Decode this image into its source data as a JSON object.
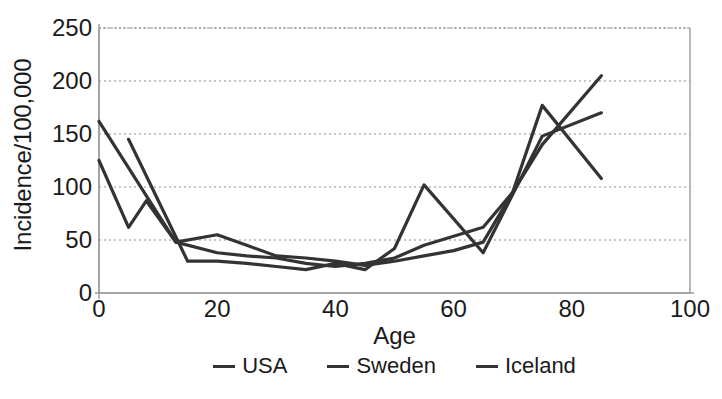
{
  "chart_data": {
    "type": "line",
    "title": "",
    "xlabel": "Age",
    "ylabel": "Incidence/100,000",
    "xlim": [
      0,
      100
    ],
    "ylim": [
      0,
      250
    ],
    "xticks": [
      0,
      20,
      40,
      60,
      80,
      100
    ],
    "yticks": [
      0,
      50,
      100,
      150,
      200,
      250
    ],
    "grid": "horizontal-dotted",
    "legend_position": "below-center",
    "line_color": "#333333",
    "series": [
      {
        "name": "USA",
        "color": "#333333",
        "x": [
          0,
          5,
          8,
          13,
          20,
          25,
          30,
          35,
          40,
          45,
          50,
          55,
          65,
          70,
          75,
          85
        ],
        "values": [
          125,
          62,
          87,
          48,
          38,
          35,
          33,
          28,
          25,
          28,
          33,
          45,
          62,
          95,
          140,
          205
        ]
      },
      {
        "name": "Sweden",
        "color": "#333333",
        "x": [
          0,
          13,
          20,
          25,
          30,
          35,
          40,
          45,
          50,
          55,
          60,
          65,
          70,
          75,
          85
        ],
        "values": [
          162,
          48,
          55,
          45,
          35,
          33,
          30,
          26,
          30,
          35,
          40,
          48,
          95,
          177,
          108
        ]
      },
      {
        "name": "Iceland",
        "color": "#333333",
        "x": [
          5,
          15,
          20,
          25,
          30,
          35,
          40,
          45,
          50,
          55,
          65,
          75,
          85
        ],
        "values": [
          145,
          30,
          30,
          28,
          25,
          22,
          28,
          22,
          42,
          102,
          38,
          148,
          170
        ]
      }
    ]
  },
  "legend": {
    "items": [
      {
        "label": "USA",
        "swatch": "line-swatch-icon"
      },
      {
        "label": "Sweden",
        "swatch": "line-swatch-icon"
      },
      {
        "label": "Iceland",
        "swatch": "line-swatch-icon"
      }
    ]
  }
}
